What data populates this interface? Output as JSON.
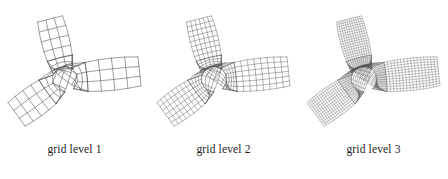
{
  "figure": {
    "background_color": "#ffffff",
    "line_color": "#4d4d4d",
    "caption_color": "#1a1a1a"
  },
  "panels": [
    {
      "caption": "grid level 1",
      "level": 1,
      "refine": 1,
      "mesh_name": "quadrilateral-mesh-level-1"
    },
    {
      "caption": "grid level 2",
      "level": 2,
      "refine": 2,
      "mesh_name": "quadrilateral-mesh-level-2"
    },
    {
      "caption": "grid level 3",
      "level": 3,
      "refine": 4,
      "mesh_name": "quadrilateral-mesh-level-3"
    }
  ],
  "chart_data": {
    "type": "diagram",
    "title": "",
    "subtitle": "",
    "geometry": {
      "domain": "Y-junction pipe with circular interior hole",
      "hole": {
        "center": [
          0.0,
          0.0
        ],
        "radius": 0.3
      },
      "arms": [
        {
          "name": "upper-left-arm",
          "direction_deg": 104,
          "length": 1.45,
          "half_width": 0.3
        },
        {
          "name": "right-arm",
          "direction_deg": 6,
          "length": 1.75,
          "half_width": 0.34
        },
        {
          "name": "lower-left-arm",
          "direction_deg": 216,
          "length": 1.4,
          "half_width": 0.34
        }
      ]
    },
    "refinement_factors": [
      1,
      2,
      4
    ],
    "element_type": "quadrilateral",
    "captions": [
      "grid level 1",
      "grid level 2",
      "grid level 3"
    ],
    "xlabel": "",
    "ylabel": "",
    "legend": []
  }
}
